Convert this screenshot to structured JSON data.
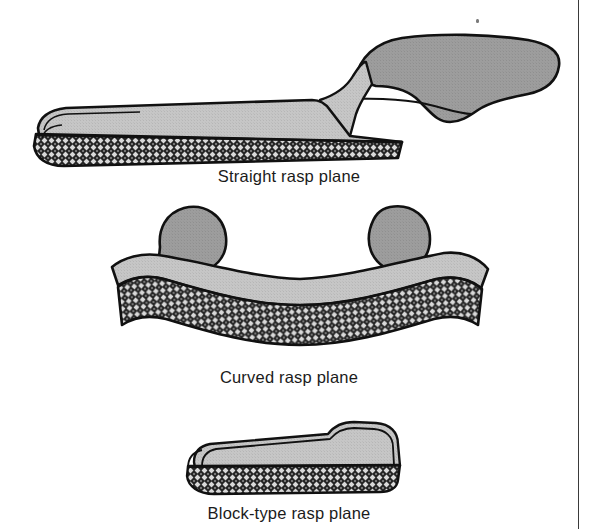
{
  "page": {
    "background_color": "#ffffff",
    "width": 600,
    "height": 529,
    "divider_color": "#3a3a3a"
  },
  "palette": {
    "outline": "#111111",
    "body_top_light": "#c4c4c4",
    "body_side_mid": "#9d9d9d",
    "handle_gray": "#9a9a9a",
    "rasp_dark": "#2b2b2b",
    "rasp_speckle": "#d8d8d8",
    "caption_text": "#1b1b1b",
    "white": "#ffffff"
  },
  "figures": [
    {
      "id": "straight-rasp-plane",
      "caption": "Straight rasp plane",
      "parts": [
        {
          "name": "sole-rasp-face",
          "finish": "crosshatch-rasp"
        },
        {
          "name": "body-top-face",
          "finish": "flat-gray"
        },
        {
          "name": "offset-handle",
          "finish": "mid-gray"
        },
        {
          "name": "handle-riser",
          "finish": "light-gray"
        }
      ]
    },
    {
      "id": "curved-rasp-plane",
      "caption": "Curved rasp plane",
      "parts": [
        {
          "name": "sole-rasp-face",
          "finish": "crosshatch-rasp"
        },
        {
          "name": "body-top-face",
          "finish": "flat-gray"
        },
        {
          "name": "left-knob",
          "finish": "mid-gray"
        },
        {
          "name": "right-knob",
          "finish": "mid-gray"
        }
      ]
    },
    {
      "id": "block-type-rasp-plane",
      "caption": "Block-type rasp plane",
      "parts": [
        {
          "name": "sole-rasp-face",
          "finish": "crosshatch-rasp"
        },
        {
          "name": "body-top-face",
          "finish": "flat-gray"
        },
        {
          "name": "stepped-heel",
          "finish": "light-gray"
        }
      ]
    }
  ],
  "captions": {
    "straight": "Straight rasp plane",
    "curved": "Curved rasp plane",
    "block": "Block-type rasp plane"
  },
  "marks": {
    "speck": "stray-ink-speck"
  }
}
